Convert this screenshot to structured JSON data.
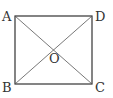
{
  "diagram": {
    "type": "square-with-diagonals",
    "vertices": {
      "A": {
        "label": "A",
        "x": 15,
        "y": 16
      },
      "D": {
        "label": "D",
        "x": 92,
        "y": 16
      },
      "B": {
        "label": "B",
        "x": 15,
        "y": 84
      },
      "C": {
        "label": "C",
        "x": 92,
        "y": 84
      }
    },
    "center": {
      "label": "O"
    },
    "stroke_color": "#333333",
    "background": "#ffffff"
  }
}
